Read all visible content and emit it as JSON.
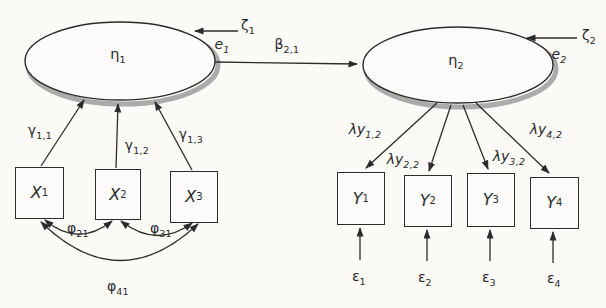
{
  "colors": {
    "ink": "#2b2b2b",
    "shadow": "#ababab",
    "paper": "#fbfaf7",
    "paper2": "#fcfbf9"
  },
  "latent": {
    "eta1": {
      "base": "η",
      "sub": "1"
    },
    "eta2": {
      "base": "η",
      "sub": "2"
    }
  },
  "x_indicators": [
    {
      "base": "X",
      "sub": "1"
    },
    {
      "base": "X",
      "sub": "2"
    },
    {
      "base": "X",
      "sub": "3"
    }
  ],
  "y_indicators": [
    {
      "base": "Y",
      "sub": "1"
    },
    {
      "base": "Y",
      "sub": "2"
    },
    {
      "base": "Y",
      "sub": "3"
    },
    {
      "base": "Y",
      "sub": "4"
    }
  ],
  "disturbances": {
    "zeta1": {
      "base": "ζ",
      "sub": "1"
    },
    "zeta2": {
      "base": "ζ",
      "sub": "2"
    },
    "e1": {
      "base": "e",
      "sub": "1"
    },
    "e2": {
      "base": "e",
      "sub": "2"
    }
  },
  "measurement_errors": [
    {
      "base": "ε",
      "sub": "1"
    },
    {
      "base": "ε",
      "sub": "2"
    },
    {
      "base": "ε",
      "sub": "3"
    },
    {
      "base": "ε",
      "sub": "4"
    }
  ],
  "paths": {
    "beta": {
      "base": "β",
      "sub": "2,1"
    },
    "gamma": [
      {
        "base": "γ",
        "sub": "1,1"
      },
      {
        "base": "γ",
        "sub": "1,2"
      },
      {
        "base": "γ",
        "sub": "1,3"
      }
    ],
    "phi": [
      {
        "base": "φ",
        "sub": "21"
      },
      {
        "base": "φ",
        "sub": "31"
      },
      {
        "base": "φ",
        "sub": "41"
      }
    ],
    "lambda": [
      {
        "base": "λy",
        "sub": "1,2"
      },
      {
        "base": "λy",
        "sub": "2,2"
      },
      {
        "base": "λy",
        "sub": "3,2"
      },
      {
        "base": "λy",
        "sub": "4,2"
      }
    ]
  }
}
